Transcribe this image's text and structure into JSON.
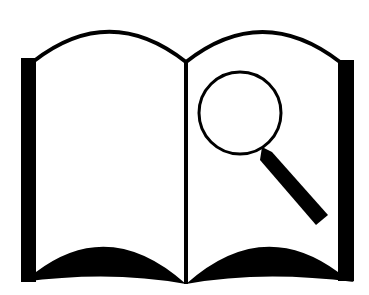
{
  "icon": {
    "name": "book-search-icon",
    "description": "Open book with magnifying glass",
    "colors": {
      "ink": "#000000",
      "background": "#ffffff"
    }
  }
}
